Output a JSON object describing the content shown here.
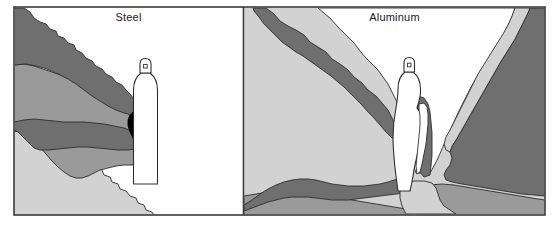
{
  "figure": {
    "type": "two-panel-contour-illustration",
    "background_color": "#ffffff",
    "frame": {
      "stroke": "#3a3a3a",
      "stroke_width": 1.6,
      "x": 14,
      "y": 7,
      "width": 531,
      "height": 208
    },
    "divider": {
      "x": 243.5,
      "y1": 7,
      "y2": 215,
      "stroke": "#3a3a3a",
      "stroke_width": 1.6
    }
  },
  "palette": {
    "zone_black": "#000000",
    "zone_dark_gray": "#6f6f6f",
    "zone_mid_gray": "#9a9a9a",
    "zone_light_gray": "#d2d2d2",
    "zone_white": "#ffffff",
    "outline": "#2e2e2e",
    "frame_stroke": "#3a3a3a",
    "label_color": "#1a1a1a"
  },
  "panels": [
    {
      "id": "steel",
      "title": "Steel",
      "title_align": "center",
      "bounds": {
        "x": 14,
        "y": 7,
        "width": 229,
        "height": 208
      },
      "cylinder": {
        "label": "gas-cylinder",
        "fill": "#ffffff",
        "outline": "#2e2e2e"
      },
      "zones": [
        {
          "name": "black-zone",
          "color": "#000000",
          "position": "adjacent to cylinder left face, narrow vertical plume"
        },
        {
          "name": "dark-gray-zone",
          "color": "#6f6f6f",
          "position": "upper-left wedge and central horizontal lobe extending left from cylinder"
        },
        {
          "name": "mid-gray-zone",
          "color": "#9a9a9a",
          "position": "broad band beneath and around the dark-gray lobes, left half"
        },
        {
          "name": "light-gray-zone",
          "color": "#d2d2d2",
          "position": "lower-left triangular fan"
        },
        {
          "name": "white-zone",
          "color": "#ffffff",
          "position": "remaining panel area, right of cylinder and top-right"
        }
      ]
    },
    {
      "id": "aluminum",
      "title": "Aluminum",
      "title_align": "center",
      "bounds": {
        "x": 243.5,
        "y": 7,
        "width": 301.5,
        "height": 208
      },
      "cylinder": {
        "label": "gas-cylinder",
        "fill": "#ffffff",
        "outline": "#2e2e2e"
      },
      "zones": [
        {
          "name": "dark-gray-zone",
          "color": "#6f6f6f",
          "position": "diagonal band from upper-left to centre, large right-hand mass, and lower-left lobe"
        },
        {
          "name": "mid-gray-zone",
          "color": "#9a9a9a",
          "position": "lower-left floor band and lower-right floor band"
        },
        {
          "name": "light-gray-zone",
          "color": "#d2d2d2",
          "position": "left field, upper-right diagonal band, and lower-centre floor"
        },
        {
          "name": "white-zone",
          "color": "#ffffff",
          "position": "central V-shaped corridor above and around the cylinder"
        }
      ]
    }
  ]
}
